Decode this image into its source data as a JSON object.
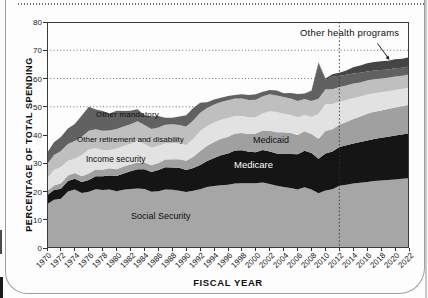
{
  "figure": {
    "kind": "scanned report figure",
    "divider_note": "dashed vertical line at fiscal year 2012 separating historical data from projections"
  },
  "chart_data": {
    "type": "area",
    "stacked": true,
    "xlabel": "FISCAL YEAR",
    "ylabel": "PERCENTAGE OF TOTAL SPENDING",
    "x_start": 1970,
    "x_end": 2022,
    "x_tick_step": 2,
    "ylim": [
      0,
      80
    ],
    "ytick_step": 10,
    "gridlines_y": [
      50,
      60,
      70
    ],
    "grid_style": "dotted",
    "divider_x": 2012,
    "legend": "labels drawn inside bands, no legend box",
    "years": [
      1970,
      1971,
      1972,
      1973,
      1974,
      1975,
      1976,
      1977,
      1978,
      1979,
      1980,
      1981,
      1982,
      1983,
      1984,
      1985,
      1986,
      1987,
      1988,
      1989,
      1990,
      1991,
      1992,
      1993,
      1994,
      1995,
      1996,
      1997,
      1998,
      1999,
      2000,
      2001,
      2002,
      2003,
      2004,
      2005,
      2006,
      2007,
      2008,
      2009,
      2010,
      2011,
      2012,
      2013,
      2014,
      2015,
      2016,
      2017,
      2018,
      2019,
      2020,
      2021,
      2022
    ],
    "series": [
      {
        "name": "Social Security",
        "color": "#a6a6a6",
        "values": [
          15.5,
          17.1,
          17.4,
          20.0,
          20.7,
          19.5,
          19.9,
          20.8,
          20.5,
          20.7,
          20.1,
          20.6,
          20.9,
          21.1,
          20.9,
          19.9,
          20.1,
          20.7,
          20.6,
          20.3,
          19.8,
          20.3,
          20.8,
          21.6,
          21.9,
          22.2,
          22.4,
          22.8,
          22.9,
          22.9,
          22.9,
          23.2,
          22.7,
          22.0,
          21.6,
          21.2,
          20.7,
          21.5,
          20.7,
          19.4,
          20.4,
          20.8,
          22.0,
          22.4,
          22.8,
          23.1,
          23.4,
          23.7,
          23.9,
          24.1,
          24.3,
          24.5,
          24.7
        ]
      },
      {
        "name": "Medicare",
        "color": "#151515",
        "values": [
          3.2,
          3.4,
          3.6,
          3.7,
          3.8,
          3.9,
          4.2,
          4.6,
          4.9,
          5.0,
          5.4,
          5.8,
          6.3,
          6.8,
          7.0,
          7.0,
          7.5,
          7.9,
          7.9,
          8.1,
          7.8,
          8.0,
          8.6,
          9.2,
          10.0,
          10.6,
          11.1,
          11.7,
          11.7,
          11.2,
          11.0,
          11.5,
          11.5,
          11.4,
          11.7,
          12.1,
          12.5,
          12.9,
          12.9,
          12.2,
          13.1,
          13.4,
          13.8,
          14.0,
          14.2,
          14.4,
          14.7,
          14.9,
          15.1,
          15.3,
          15.5,
          15.7,
          15.9
        ]
      },
      {
        "name": "Medicaid",
        "color": "#a0a0a0",
        "values": [
          1.4,
          1.6,
          1.9,
          2.0,
          2.1,
          2.0,
          2.3,
          2.4,
          2.3,
          2.5,
          2.4,
          2.5,
          2.4,
          2.4,
          2.4,
          2.4,
          2.5,
          2.7,
          2.9,
          3.0,
          3.3,
          4.0,
          4.9,
          5.4,
          5.6,
          5.9,
          5.9,
          6.0,
          6.1,
          6.3,
          6.6,
          6.9,
          7.3,
          7.6,
          7.7,
          7.4,
          6.8,
          6.9,
          6.8,
          7.1,
          7.9,
          7.8,
          7.8,
          8.2,
          8.7,
          9.1,
          9.4,
          9.6,
          9.7,
          9.8,
          9.9,
          10.0,
          10.1
        ]
      },
      {
        "name": "Income security",
        "color": "#e2e2e2",
        "values": [
          4.5,
          5.5,
          5.8,
          5.2,
          5.0,
          7.5,
          8.5,
          7.5,
          7.0,
          6.5,
          7.3,
          7.2,
          7.3,
          7.8,
          6.5,
          6.2,
          6.1,
          5.7,
          5.8,
          5.6,
          5.6,
          6.3,
          7.1,
          7.0,
          6.9,
          6.7,
          6.6,
          6.2,
          6.0,
          5.9,
          5.9,
          6.1,
          6.9,
          7.1,
          6.5,
          6.4,
          6.3,
          5.8,
          6.0,
          8.8,
          9.6,
          9.0,
          8.2,
          7.8,
          7.4,
          7.0,
          6.8,
          6.6,
          6.4,
          6.3,
          6.2,
          6.1,
          6.0
        ]
      },
      {
        "name": "Other retirement and disability",
        "color": "#bfbfbf",
        "values": [
          5.0,
          5.3,
          5.6,
          5.9,
          6.3,
          6.5,
          6.6,
          6.7,
          6.8,
          6.9,
          6.9,
          6.9,
          6.9,
          6.8,
          6.7,
          6.6,
          6.5,
          6.6,
          6.6,
          6.5,
          6.5,
          6.5,
          6.5,
          6.4,
          6.4,
          6.3,
          6.3,
          6.2,
          6.2,
          6.1,
          6.1,
          6.0,
          6.0,
          5.9,
          5.9,
          5.8,
          5.7,
          5.6,
          5.6,
          5.3,
          5.2,
          5.2,
          5.2,
          5.1,
          5.1,
          5.0,
          5.0,
          4.9,
          4.9,
          4.8,
          4.8,
          4.7,
          4.7
        ]
      },
      {
        "name": "Other mandatory",
        "color": "#616161",
        "values": [
          4.0,
          4.5,
          5.0,
          5.5,
          6.0,
          7.5,
          8.5,
          7.0,
          7.0,
          6.0,
          6.5,
          5.5,
          4.8,
          4.2,
          3.5,
          4.5,
          4.0,
          2.5,
          2.3,
          3.0,
          4.0,
          4.5,
          3.5,
          2.0,
          1.8,
          1.5,
          1.5,
          1.3,
          1.5,
          1.8,
          1.9,
          1.6,
          1.5,
          1.8,
          1.4,
          2.0,
          2.5,
          2.0,
          3.5,
          12.5,
          3.3,
          4.5,
          4.0,
          3.8,
          3.6,
          3.4,
          3.2,
          3.1,
          3.0,
          2.9,
          2.9,
          2.8,
          2.8
        ]
      },
      {
        "name": "Other health programs",
        "color": "#454545",
        "values": [
          0,
          0,
          0,
          0,
          0,
          0,
          0,
          0,
          0,
          0,
          0,
          0,
          0,
          0,
          0,
          0,
          0,
          0,
          0,
          0,
          0,
          0,
          0,
          0,
          0,
          0,
          0,
          0,
          0,
          0,
          0,
          0,
          0,
          0,
          0,
          0,
          0,
          0,
          0.2,
          0.4,
          0.5,
          0.8,
          1.0,
          1.5,
          2.2,
          2.6,
          2.9,
          3.0,
          3.1,
          3.1,
          3.2,
          3.2,
          3.3
        ]
      }
    ],
    "annotation": {
      "text": "Other health programs",
      "points_to": "top band, around fiscal year 2019"
    }
  }
}
